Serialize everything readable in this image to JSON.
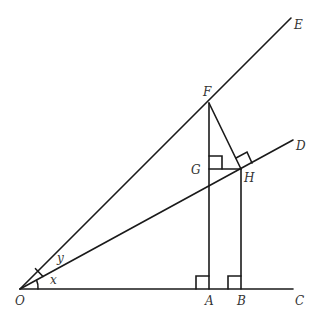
{
  "diagram": {
    "points": {
      "O": {
        "label": "O",
        "x": 20,
        "y": 289
      },
      "A": {
        "label": "A",
        "x": 209,
        "y": 289
      },
      "B": {
        "label": "B",
        "x": 241,
        "y": 289
      },
      "C": {
        "label": "C",
        "x": 293,
        "y": 289
      },
      "D": {
        "label": "D",
        "x": 293,
        "y": 140
      },
      "E": {
        "label": "E",
        "x": 291,
        "y": 18
      },
      "F": {
        "label": "F",
        "x": 209,
        "y": 103
      },
      "G": {
        "label": "G",
        "x": 209,
        "y": 169
      },
      "H": {
        "label": "H",
        "x": 241,
        "y": 169
      }
    },
    "angles": {
      "x": "x",
      "y": "y"
    },
    "segments": [
      "OC",
      "OD",
      "OE",
      "FA",
      "HB",
      "FH",
      "GH"
    ],
    "right_angles": [
      "A",
      "B",
      "G",
      "H"
    ]
  }
}
